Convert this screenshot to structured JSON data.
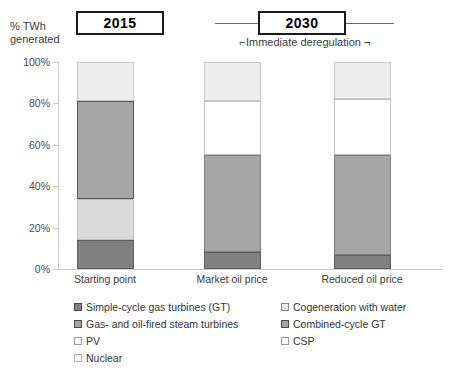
{
  "axis_title": {
    "line1": "% TWh",
    "line2": "generated"
  },
  "periods": [
    {
      "label": "2015",
      "name": "period-2015"
    },
    {
      "label": "2030",
      "name": "period-2030"
    }
  ],
  "annotation": {
    "left_tick": "⌐",
    "text": "Immediate deregulation",
    "right_tick": "¬",
    "full": "⌐Immediate deregulation ¬"
  },
  "legend": {
    "left": [
      {
        "label": "Simple-cycle gas turbines (GT)",
        "key": "simple",
        "color": "#808080"
      },
      {
        "label": "Gas- and oil-fired steam turbines",
        "key": "steam",
        "color": "#a6a6a6"
      },
      {
        "label": "PV",
        "key": "pv",
        "color": "#ffffff"
      },
      {
        "label": "Nuclear",
        "key": "nuclear",
        "color": "#fafafa"
      }
    ],
    "right": [
      {
        "label": "Cogeneration with water",
        "key": "cogen",
        "color": "#ededed"
      },
      {
        "label": "Combined-cycle GT",
        "key": "ccgt",
        "color": "#a6a6a6"
      },
      {
        "label": "CSP",
        "key": "csp",
        "color": "#ffffff"
      }
    ]
  },
  "chart_data": {
    "type": "bar",
    "subtype": "stacked-100-percent",
    "title": "",
    "xlabel": "",
    "ylabel": "% TWh generated",
    "ylim": [
      0,
      100
    ],
    "ytick_labels": [
      "0%",
      "20%",
      "40%",
      "60%",
      "80%",
      "100%"
    ],
    "ytick_values": [
      0,
      20,
      40,
      60,
      80,
      100
    ],
    "grid": false,
    "legend_position": "bottom",
    "categories": [
      "Starting point",
      "Market oil price",
      "Reduced oil price"
    ],
    "category_groups": [
      "2015",
      "2030",
      "2030"
    ],
    "series": [
      {
        "name": "Simple-cycle gas turbines (GT)",
        "key": "simple",
        "color": "#808080",
        "values": [
          14,
          8,
          7
        ]
      },
      {
        "name": "Gas- and oil-fired steam turbines",
        "key": "steam",
        "color": "#a6a6a6",
        "values": [
          20,
          0,
          0
        ]
      },
      {
        "name": "Combined-cycle GT",
        "key": "ccgt",
        "color": "#a6a6a6",
        "values": [
          47,
          47,
          48
        ]
      },
      {
        "name": "CSP",
        "key": "csp",
        "color": "#ffffff",
        "values": [
          0,
          26,
          27
        ]
      },
      {
        "name": "Cogeneration with water",
        "key": "cogen",
        "color": "#ededed",
        "values": [
          19,
          19,
          18
        ]
      }
    ],
    "stack_order_bottom_to_top": [
      "simple",
      "steam",
      "ccgt",
      "csp",
      "cogen"
    ],
    "bars": [
      {
        "category": "Starting point",
        "group": "2015",
        "segments": [
          {
            "key": "simple",
            "label": "Simple-cycle gas turbines (GT)",
            "start": 0,
            "end": 14,
            "value": 14
          },
          {
            "key": "pv",
            "label": "PV",
            "start": 14,
            "end": 34,
            "value": 20
          },
          {
            "key": "steam",
            "label": "Gas- and oil-fired steam turbines",
            "start": 34,
            "end": 81,
            "value": 47
          },
          {
            "key": "cogen",
            "label": "Cogeneration with water",
            "start": 81,
            "end": 100,
            "value": 19
          }
        ]
      },
      {
        "category": "Market oil price",
        "group": "2030",
        "segments": [
          {
            "key": "simple",
            "label": "Simple-cycle gas turbines (GT)",
            "start": 0,
            "end": 8,
            "value": 8
          },
          {
            "key": "ccgt",
            "label": "Combined-cycle GT",
            "start": 8,
            "end": 55,
            "value": 47
          },
          {
            "key": "csp",
            "label": "CSP",
            "start": 55,
            "end": 81,
            "value": 26
          },
          {
            "key": "cogen",
            "label": "Cogeneration with water",
            "start": 81,
            "end": 100,
            "value": 19
          }
        ]
      },
      {
        "category": "Reduced oil price",
        "group": "2030",
        "segments": [
          {
            "key": "simple",
            "label": "Simple-cycle gas turbines (GT)",
            "start": 0,
            "end": 7,
            "value": 7
          },
          {
            "key": "ccgt",
            "label": "Combined-cycle GT",
            "start": 7,
            "end": 55,
            "value": 48
          },
          {
            "key": "csp",
            "label": "CSP",
            "start": 55,
            "end": 82,
            "value": 27
          },
          {
            "key": "cogen",
            "label": "Cogeneration with water",
            "start": 82,
            "end": 100,
            "value": 18
          }
        ]
      }
    ]
  }
}
